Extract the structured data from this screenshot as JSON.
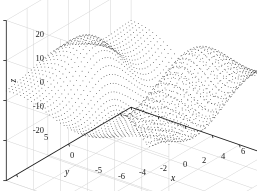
{
  "figure": {
    "background_color": "#ffffff",
    "mesh_color": "#3c3c3c",
    "surface_fill_color": "#ffffff",
    "grid_color": "#d2d2d2",
    "axis_color": "#1a1a1a",
    "width": 257,
    "height": 191
  },
  "chart_data": {
    "type": "scatter",
    "render_style": "3d-mesh-surface-dotted",
    "title": "",
    "xlabel": "x",
    "ylabel": "y",
    "zlabel": "z",
    "xlim": [
      -6,
      6
    ],
    "ylim": [
      -6,
      6
    ],
    "zlim": [
      -20,
      20
    ],
    "xticks": [
      -6,
      -4,
      -2,
      0,
      2,
      4,
      6
    ],
    "xtick_labels": [
      "-6",
      "-4",
      "-2",
      "0",
      "2",
      "4",
      "6"
    ],
    "yticks": [
      5,
      0,
      -5
    ],
    "ytick_labels": [
      "5",
      "0",
      "-5"
    ],
    "zticks": [
      20,
      10,
      0,
      -10,
      -20
    ],
    "ztick_labels": [
      "20",
      "10",
      "0",
      "-10",
      "-20"
    ],
    "grid": true,
    "legend": null,
    "surface": {
      "function": "z = y*sin(x)*2 + peaks-like saddle",
      "formula_id": "saddle_two_lobes",
      "x_samples": 46,
      "y_samples": 46,
      "z_min_observed": -20,
      "z_max_observed": 20,
      "features": [
        {
          "name": "left-lobe-peak",
          "approx_z": 10
        },
        {
          "name": "central-valley",
          "approx_z": -15
        },
        {
          "name": "right-dome-peak",
          "approx_z": 20
        }
      ]
    },
    "view": {
      "azimuth_deg": -37.5,
      "elevation_deg": 30
    }
  },
  "labels": {
    "x_title": "x",
    "y_title": "y",
    "z_title": "z"
  }
}
